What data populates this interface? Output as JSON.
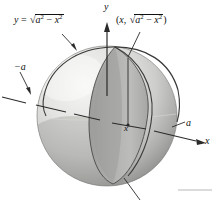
{
  "figure": {
    "background_color": "#ffffff",
    "labels": {
      "curve_equation": {
        "prefix": "y",
        "equals": "=",
        "radical_sign": "√",
        "radicand_base": "a",
        "radicand_exp": "2",
        "minus": "−",
        "subtrahend_base": "x",
        "subtrahend_exp": "2"
      },
      "point_coordinate": {
        "open_paren": "(",
        "x_part": "x",
        "comma": ",",
        "radical_sign": "√",
        "radicand_base": "a",
        "radicand_exp": "2",
        "minus": "−",
        "subtrahend_base": "x",
        "subtrahend_exp": "2",
        "close_paren": ")"
      },
      "y_axis": "y",
      "x_axis": "x",
      "negative_a": "−a",
      "positive_a": "a",
      "x_tick": "x"
    },
    "colors": {
      "stroke": "#1a1a1a",
      "sphere_light": "#eeeeec",
      "sphere_mid": "#c9c9c7",
      "sphere_shadow": "#9d9d9b",
      "wedge_face": "#b4b4b2",
      "wedge_dark": "#9a9a98",
      "disk_face": "#a8a8a6",
      "rule_line": "#b8b8b8"
    }
  }
}
